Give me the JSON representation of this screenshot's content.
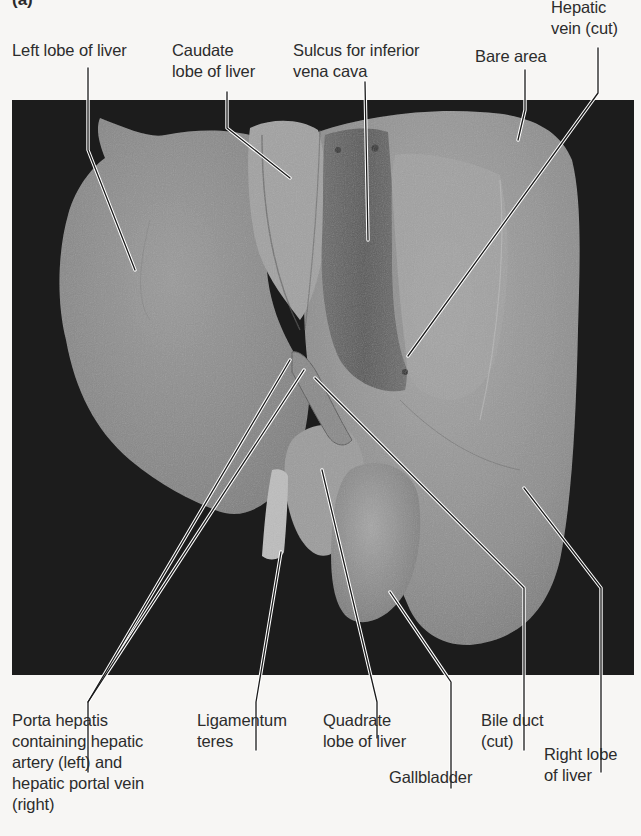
{
  "figure": {
    "letter": "(a)",
    "view": "Inferior view of liver (photograph)",
    "colors": {
      "background": "#f7f6f4",
      "photo_background": "#1c1c1c",
      "liver_tone": "#8f8f8f",
      "label_text": "#2c2c2c",
      "leader_line": "#1a1a1a",
      "leader_halo": "#ffffff"
    }
  },
  "labels_top": [
    {
      "id": "left-lobe",
      "text": "Left lobe of liver"
    },
    {
      "id": "caudate-lobe",
      "text": "Caudate\nlobe of liver"
    },
    {
      "id": "sulcus-ivc",
      "text": "Sulcus for inferior\nvena cava"
    },
    {
      "id": "bare-area",
      "text": "Bare area"
    },
    {
      "id": "hepatic-vein",
      "text": "Hepatic\nvein (cut)"
    }
  ],
  "labels_bottom": [
    {
      "id": "porta-hepatis",
      "text": "Porta hepatis\ncontaining hepatic\nartery (left) and\nhepatic portal vein\n(right)"
    },
    {
      "id": "ligamentum-teres",
      "text": "Ligamentum\nteres"
    },
    {
      "id": "quadrate-lobe",
      "text": "Quadrate\nlobe of liver"
    },
    {
      "id": "gallbladder",
      "text": "Gallbladder"
    },
    {
      "id": "bile-duct",
      "text": "Bile duct\n(cut)"
    },
    {
      "id": "right-lobe",
      "text": "Right lobe\nof liver"
    }
  ]
}
